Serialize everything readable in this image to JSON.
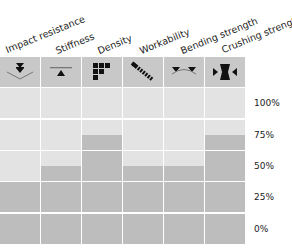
{
  "chart_data": {
    "type": "heatmap",
    "title": "",
    "categories": [
      "Impact resistance",
      "Stiffness",
      "Density",
      "Workability",
      "Bending strength",
      "Crushing strength"
    ],
    "icons": [
      "impact-icon",
      "stiffness-icon",
      "density-icon",
      "workability-icon",
      "bending-icon",
      "crushing-icon"
    ],
    "values": [
      37.5,
      50,
      75,
      50,
      50,
      75
    ],
    "y_ticks": [
      "100%",
      "75%",
      "50%",
      "25%",
      "0%"
    ],
    "ylim": [
      0,
      100
    ],
    "xlabel": "",
    "ylabel": "",
    "grid": true,
    "colors": {
      "empty": "#e3e3e3",
      "filled": "#bdbdbd",
      "header": "#c8c8c8"
    }
  }
}
